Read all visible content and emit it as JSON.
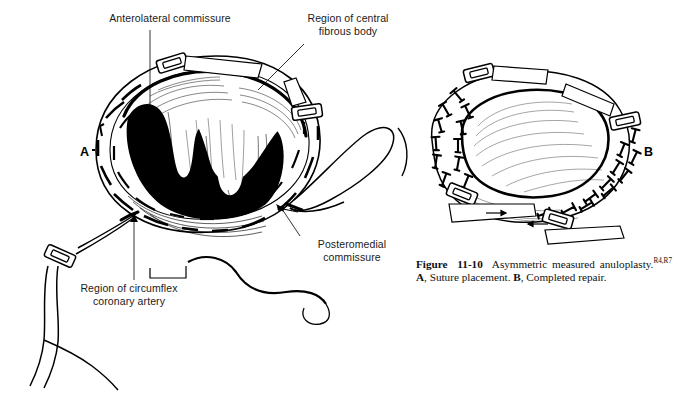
{
  "figure": {
    "background_color": "#ffffff",
    "ink_color": "#000000",
    "type": "medical-line-illustration"
  },
  "caption": {
    "number_prefix": "Figure",
    "number": "11-10",
    "text_main": "Asymmetric measured anuloplasty.",
    "references_superscript": "R4,R7",
    "part_a_letter": "A",
    "part_a_text": ", Suture placement.",
    "part_b_letter": "B",
    "part_b_text": ", Completed repair."
  },
  "panels": [
    {
      "id": "A",
      "letter": "A",
      "letter_x": 80,
      "letter_y": 145,
      "description": "Suture placement — mitral anulus with pledgeted mattress sutures placed around the posterior anulus, valve orifice shown dark, needle and suture tails exiting at lower left and right"
    },
    {
      "id": "B",
      "letter": "B",
      "letter_x": 644,
      "letter_y": 145,
      "description": "Completed repair — sutures tied down, anulus plicated and reduced, measuring tabs in place"
    }
  ],
  "labels": [
    {
      "name": "anterolateral-commissure",
      "lines": "Anterolateral commissure",
      "x": 86,
      "y": 12,
      "width": 168,
      "leader": {
        "x1": 150,
        "y1": 28,
        "x2": 150,
        "y2": 160
      }
    },
    {
      "name": "region-of-central-fibrous-body",
      "lines": "Region of central\nfibrous body",
      "x": 290,
      "y": 12,
      "width": 116,
      "leader": {
        "x1": 300,
        "y1": 40,
        "x2": 258,
        "y2": 88
      }
    },
    {
      "name": "posteromedial-commissure",
      "lines": "Posteromedial\ncommissure",
      "x": 300,
      "y": 239,
      "width": 100,
      "leader": {
        "x1": 300,
        "y1": 238,
        "x2": 283,
        "y2": 207
      }
    },
    {
      "name": "region-of-circumflex-coronary-artery",
      "lines": "Region of circumflex\ncoronary artery",
      "x": 56,
      "y": 283,
      "width": 142,
      "leader": {
        "x1": 134,
        "y1": 281,
        "x2": 134,
        "y2": 216
      }
    }
  ]
}
